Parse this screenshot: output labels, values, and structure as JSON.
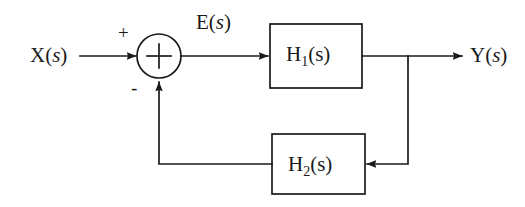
{
  "diagram": {
    "type": "control-system-block-diagram",
    "canvas": {
      "width": 525,
      "height": 207
    },
    "colors": {
      "stroke": "#1a1a1a",
      "background": "#ffffff",
      "text": "#1a1a1a"
    },
    "signals": {
      "input": {
        "name": "X(s)",
        "base": "X",
        "arg": "s"
      },
      "error": {
        "name": "E(s)",
        "base": "E",
        "arg": "s"
      },
      "output": {
        "name": "Y(s)",
        "base": "Y",
        "arg": "s"
      }
    },
    "summing_junction": {
      "name": "summing-junction",
      "symbol": "+",
      "center": {
        "x": 159,
        "y": 56
      },
      "radius": 22,
      "inputs": [
        {
          "port": "left",
          "sign": "+",
          "source": "X(s)"
        },
        {
          "port": "bottom",
          "sign": "-",
          "source": "H2(s)"
        }
      ]
    },
    "blocks": [
      {
        "id": "h1",
        "label": "H",
        "subscript": "1",
        "arg": "(s)",
        "full_label": "H1(s)",
        "path": "forward",
        "x": 270,
        "y": 24,
        "width": 92,
        "height": 64
      },
      {
        "id": "h2",
        "label": "H",
        "subscript": "2",
        "arg": "(s)",
        "full_label": "H2(s)",
        "path": "feedback",
        "x": 272,
        "y": 134,
        "width": 93,
        "height": 60
      }
    ],
    "connections": [
      {
        "name": "input-to-sum",
        "from": "X(s)",
        "to": "summing-junction",
        "arrow": true
      },
      {
        "name": "sum-to-h1",
        "from": "summing-junction",
        "to": "h1",
        "label": "E(s)",
        "arrow": true
      },
      {
        "name": "h1-to-output",
        "from": "h1",
        "to": "Y(s)",
        "arrow": true
      },
      {
        "name": "output-tap-to-h2",
        "from": "h1-output-node",
        "to": "h2",
        "arrow": true
      },
      {
        "name": "h2-to-sum",
        "from": "h2",
        "to": "summing-junction",
        "arrow": true,
        "sign": "-"
      }
    ]
  }
}
